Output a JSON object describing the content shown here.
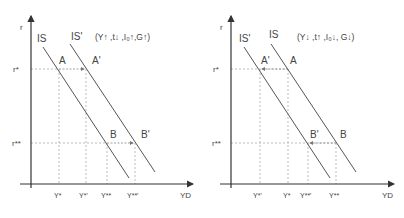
{
  "left": {
    "y_axis_label": "r",
    "x_axis_label": "YD",
    "curve_1_label": "IS",
    "curve_2_label": "IS'",
    "caption": "(Y↑ ,t↓ ,I₀↑,G↑)",
    "r_star": "r*",
    "r_star_star": "r**",
    "point_a": "A",
    "point_a_prime": "A'",
    "point_b": "B",
    "point_b_prime": "B'",
    "ticks": [
      "Y*",
      "Y*'",
      "Y**",
      "Y**'"
    ]
  },
  "right": {
    "y_axis_label": "r",
    "x_axis_label": "YD",
    "curve_1_label": "IS'",
    "curve_2_label": "IS",
    "caption": "(Y↓ ,t↑ ,I₀↓, G↓)",
    "r_star": "r*",
    "r_star_star": "r**",
    "point_a": "A",
    "point_a_prime": "A'",
    "point_b": "B",
    "point_b_prime": "B'",
    "ticks": [
      "Y*'",
      "Y*",
      "Y**'",
      "Y**"
    ]
  },
  "colors": {
    "axis": "#333333",
    "curve": "#555555",
    "guide": "#aaaaaa",
    "text": "#444444"
  }
}
